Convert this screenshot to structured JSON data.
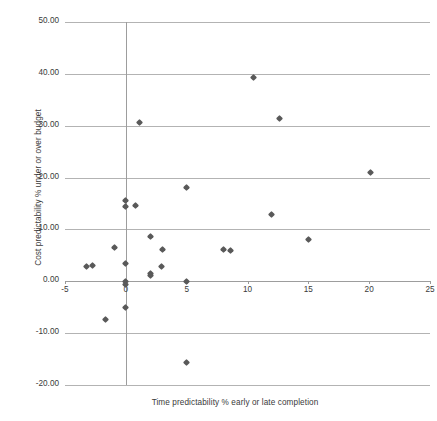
{
  "chart_data": {
    "type": "scatter",
    "title": "",
    "xlabel": "Time predictability % early or late completion",
    "ylabel": "Cost predictability % under or over budget",
    "xlim": [
      -5,
      25
    ],
    "ylim": [
      -20,
      50
    ],
    "xticks": [
      -5,
      0,
      5,
      10,
      15,
      20,
      25
    ],
    "xtick_labels": [
      "-5",
      "0",
      "5",
      "10",
      "15",
      "20",
      "25"
    ],
    "yticks": [
      50,
      40,
      30,
      20,
      10,
      0,
      -10,
      -20
    ],
    "ytick_labels": [
      "50.00",
      "40.00",
      "30.00",
      "20.00",
      "10.00",
      "0.00",
      "-10.00",
      "-20.00"
    ],
    "grid": "horizontal",
    "legend": "none",
    "marker": "diamond",
    "marker_color": "#595959",
    "points": [
      {
        "x": -3.2,
        "y": 2.8
      },
      {
        "x": -2.7,
        "y": 3.1
      },
      {
        "x": -1.7,
        "y": -7.4
      },
      {
        "x": -0.9,
        "y": 6.5
      },
      {
        "x": 0.0,
        "y": 15.6
      },
      {
        "x": 0.0,
        "y": 14.5
      },
      {
        "x": 0.0,
        "y": 3.4
      },
      {
        "x": 0.0,
        "y": 0.0
      },
      {
        "x": 0.0,
        "y": -0.6
      },
      {
        "x": 0.0,
        "y": -5.0
      },
      {
        "x": 0.8,
        "y": 14.7
      },
      {
        "x": 1.1,
        "y": 30.6
      },
      {
        "x": 2.0,
        "y": 8.6
      },
      {
        "x": 2.0,
        "y": 1.5
      },
      {
        "x": 2.0,
        "y": 1.1
      },
      {
        "x": 2.9,
        "y": 2.8
      },
      {
        "x": 3.0,
        "y": 6.1
      },
      {
        "x": 5.0,
        "y": 18.0
      },
      {
        "x": 5.0,
        "y": 0.0
      },
      {
        "x": 5.0,
        "y": -15.7
      },
      {
        "x": 8.0,
        "y": 6.1
      },
      {
        "x": 8.6,
        "y": 6.0
      },
      {
        "x": 10.5,
        "y": 39.3
      },
      {
        "x": 12.0,
        "y": 12.8
      },
      {
        "x": 12.6,
        "y": 31.3
      },
      {
        "x": 15.0,
        "y": 8.0
      },
      {
        "x": 20.1,
        "y": 21.0
      }
    ]
  },
  "colors": {
    "marker": "#595959",
    "gridline": "#b3b3b3",
    "axis": "#9d9d9d",
    "text": "#3a3a3a",
    "background": "#ffffff"
  }
}
